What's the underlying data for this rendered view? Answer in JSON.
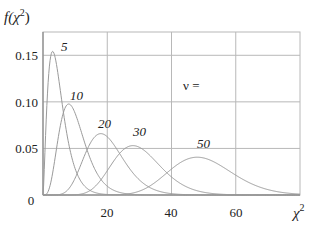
{
  "chart_data": {
    "type": "line",
    "title": "",
    "ylabel": "f(χ²)",
    "xlabel": "χ²",
    "xlim": [
      0,
      80
    ],
    "ylim": [
      0,
      0.175
    ],
    "xticks": [
      20,
      40,
      60
    ],
    "xtick_labels": [
      "20",
      "40",
      "60"
    ],
    "yticks": [
      0,
      0.05,
      0.1,
      0.15
    ],
    "ytick_labels": [
      "0",
      "0.05",
      "0.10",
      "0.15"
    ],
    "grid": true,
    "legend_title": "ν =",
    "series": [
      {
        "name": "5",
        "dof": 5,
        "mode_x": 3,
        "peak_y": 0.154,
        "label_pos": [
          6,
          0.158
        ]
      },
      {
        "name": "10",
        "dof": 10,
        "mode_x": 8,
        "peak_y": 0.098,
        "label_pos": [
          9.5,
          0.103
        ]
      },
      {
        "name": "20",
        "dof": 20,
        "mode_x": 18,
        "peak_y": 0.066,
        "label_pos": [
          16.5,
          0.071
        ]
      },
      {
        "name": "30",
        "dof": 30,
        "mode_x": 28,
        "peak_y": 0.053,
        "label_pos": [
          26.5,
          0.062
        ]
      },
      {
        "name": "50",
        "dof": 50,
        "mode_x": 48,
        "peak_y": 0.041,
        "label_pos": [
          45.5,
          0.051
        ]
      }
    ]
  },
  "colors": {
    "grid": "#b8b8b8",
    "axis": "#888888",
    "curve": "#9a9a9a",
    "text": "#222222"
  },
  "labels": {
    "y_axis_f": "f(",
    "y_axis_chi": "χ",
    "y_axis_sup": "2",
    "y_axis_close": ")",
    "x_axis_chi": "χ",
    "x_axis_sup": "2",
    "x_tick_0": "20",
    "x_tick_1": "40",
    "x_tick_2": "60",
    "y_tick_0": "0",
    "y_tick_1": "0.05",
    "y_tick_2": "0.10",
    "y_tick_3": "0.15",
    "nu": "ν =",
    "c5": "5",
    "c10": "10",
    "c20": "20",
    "c30": "30",
    "c50": "50"
  }
}
